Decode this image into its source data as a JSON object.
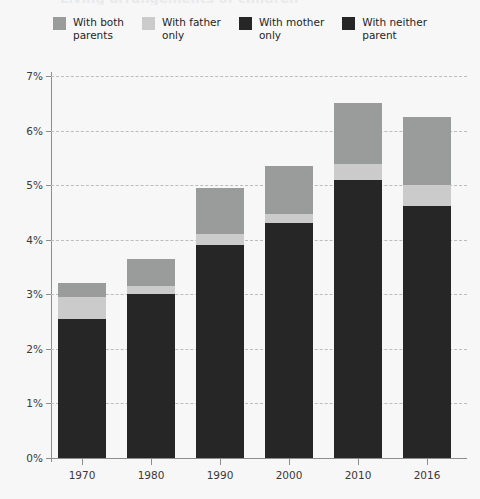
{
  "title": "Living arrangements of children",
  "legend": {
    "position": "top-center",
    "items": [
      {
        "label": "With both\nparents",
        "name": "with-both-parents",
        "color": "#9a9b9b"
      },
      {
        "label": "With father\nonly",
        "name": "with-father-only",
        "color": "#cacbca"
      },
      {
        "label": "With mother\nonly",
        "name": "with-mother-only",
        "color": "#262626"
      },
      {
        "label": "With neither\nparent",
        "name": "with-neither-parent",
        "color": "#262626"
      }
    ]
  },
  "colors": {
    "both_parents": "#9a9b9b",
    "father_only": "#cacbca",
    "mother_only": "#262626",
    "neither_parent": "#262626",
    "gridline": "#bdbdbd",
    "axis": "#8d8d8d",
    "background": "#f7f7f7",
    "text": "#2b2b2b"
  },
  "axes": {
    "y_ticks": [
      "0%",
      "1%",
      "2%",
      "3%",
      "4%",
      "5%",
      "6%",
      "7%"
    ],
    "y_tick_values": [
      0,
      1,
      2,
      3,
      4,
      5,
      6,
      7
    ],
    "x_ticks": [
      "1970",
      "1980",
      "1990",
      "2000",
      "2010",
      "2016"
    ]
  },
  "chart_data": {
    "type": "bar",
    "subtype": "stacked",
    "title": "Living arrangements of children",
    "xlabel": "",
    "ylabel": "",
    "ylim": [
      0,
      7
    ],
    "yunit": "%",
    "grid": true,
    "legend_position": "top-center",
    "categories": [
      "1970",
      "1980",
      "1990",
      "2000",
      "2010",
      "2016"
    ],
    "series": [
      {
        "name": "With mother only",
        "color": "#262626",
        "values": [
          2.55,
          3.0,
          3.9,
          4.3,
          5.1,
          4.62
        ]
      },
      {
        "name": "With father only",
        "color": "#cacbca",
        "values": [
          0.4,
          0.15,
          0.2,
          0.18,
          0.28,
          0.38
        ]
      },
      {
        "name": "With both parents",
        "color": "#9a9b9b",
        "values": [
          0.25,
          0.5,
          0.85,
          0.87,
          1.12,
          1.25
        ]
      }
    ],
    "totals": [
      3.2,
      3.65,
      4.95,
      5.35,
      6.5,
      6.25
    ]
  }
}
